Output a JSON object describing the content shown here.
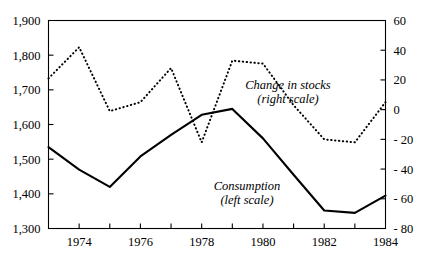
{
  "chart_data": {
    "type": "line",
    "title": "",
    "subtitle": "",
    "xlabel": "",
    "ylabel": "",
    "grid": false,
    "legend_position": "inline-annotation",
    "x": [
      1973,
      1974,
      1975,
      1976,
      1977,
      1978,
      1979,
      1980,
      1981,
      1982,
      1983,
      1984
    ],
    "x_tick_values": [
      1973,
      1974,
      1975,
      1976,
      1977,
      1978,
      1979,
      1980,
      1981,
      1982,
      1983,
      1984
    ],
    "x_tick_labels": [
      "",
      "1974",
      "",
      "1976",
      "",
      "1978",
      "",
      "1980",
      "",
      "1982",
      "",
      "1984"
    ],
    "xlim": [
      1973,
      1984
    ],
    "left_axis": {
      "label": "",
      "ylim": [
        1300,
        1900
      ],
      "ticks": [
        1300,
        1400,
        1500,
        1600,
        1700,
        1800,
        1900
      ],
      "tick_labels": [
        "1,300",
        "1,400",
        "1,500",
        "1,600",
        "1,700",
        "1,800",
        "1,900"
      ]
    },
    "right_axis": {
      "label": "",
      "ylim": [
        -80,
        60
      ],
      "ticks": [
        -80,
        -60,
        -40,
        -20,
        0,
        20,
        40,
        60
      ],
      "tick_labels": [
        "- 80",
        "- 60",
        "- 40",
        "- 20",
        "0",
        "20",
        "40",
        "60"
      ]
    },
    "series": [
      {
        "name": "Consumption",
        "axis": "left",
        "style": "solid",
        "values": [
          1535,
          1470,
          1420,
          1508,
          1570,
          1628,
          1645,
          1560,
          1455,
          1352,
          1345,
          1395
        ]
      },
      {
        "name": "Change in stocks",
        "axis": "right",
        "style": "dotted",
        "values": [
          21,
          42,
          -1,
          5,
          28,
          -22,
          33,
          31,
          3,
          -20,
          -22,
          5
        ]
      }
    ],
    "annotations": [
      {
        "id": "stocks-annotation",
        "line1": "Change in stocks",
        "line2": "(right scale)",
        "x_px": 288,
        "y_px": 89
      },
      {
        "id": "consumption-annotation",
        "line1": "Consumption",
        "line2": "(left scale)",
        "x_px": 247,
        "y_px": 190
      }
    ]
  }
}
